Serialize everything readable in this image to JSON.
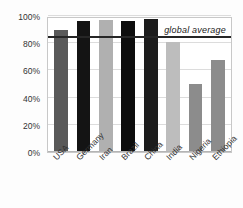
{
  "chart_data": {
    "type": "bar",
    "title": "",
    "xlabel": "",
    "ylabel": "",
    "categories": [
      "USA",
      "Germany",
      "Iran",
      "Brazil",
      "China",
      "India",
      "Nigeria",
      "Ethiopia"
    ],
    "values": [
      90,
      96,
      97,
      96,
      97.5,
      81,
      50,
      68
    ],
    "bar_colors": [
      "#595959",
      "#141414",
      "#b0b0b0",
      "#0d0d0d",
      "#1c1c1c",
      "#bdbdbd",
      "#8c8c8c",
      "#8c8c8c"
    ],
    "ylim": [
      0,
      100
    ],
    "ytick_values": [
      0,
      20,
      40,
      60,
      80,
      100
    ],
    "ytick_labels": [
      "0%",
      "20%",
      "40%",
      "60%",
      "80%",
      "100%"
    ],
    "grid": true,
    "legend": "none",
    "annotations": [
      {
        "name": "global-average",
        "label": "global average",
        "value": 84,
        "style": "horizontal-line",
        "color": "#262626"
      }
    ]
  },
  "axis": {
    "y_tick_labels": [
      "100%",
      "80%",
      "60%",
      "40%",
      "20%",
      "0%"
    ],
    "x_tick_labels": [
      "USA",
      "Germany",
      "Iran",
      "Brazil",
      "China",
      "India",
      "Nigeria",
      "Ethiopia"
    ]
  },
  "annotation": {
    "global_average_label": "global average"
  },
  "colors": {
    "grid": "#dcdcdc",
    "frame": "#c8c8c8",
    "average_line": "#262626",
    "background": "#fdfdfd",
    "plot_background": "#ffffff"
  }
}
